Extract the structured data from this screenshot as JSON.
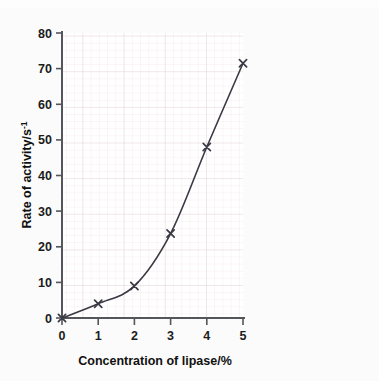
{
  "figure": {
    "background_color": "#fbfbfb",
    "plot_background_color": "#ffffff",
    "axis_color": "#4a4a4a",
    "grid_major_color": "#e6d9dc",
    "grid_minor_color": "#f1e6e8",
    "series_color": "#3a3a44",
    "marker": "x"
  },
  "chart_data": {
    "type": "line",
    "title": "",
    "subtitle": "",
    "xlabel": "Concentration of lipase/%",
    "ylabel": "Rate of activity/s",
    "ylabel_superscript": "-1",
    "x": [
      0,
      1,
      2,
      3,
      4,
      5
    ],
    "values": [
      0,
      4,
      9,
      23.7,
      48,
      71.5
    ],
    "series": [
      {
        "name": "Rate of activity",
        "x": [
          0,
          1,
          2,
          3,
          4,
          5
        ],
        "values": [
          0,
          4,
          9,
          23.7,
          48,
          71.5
        ]
      }
    ],
    "xlim": [
      0,
      5
    ],
    "ylim": [
      0,
      80
    ],
    "xticks": [
      0,
      1,
      2,
      3,
      4,
      5
    ],
    "yticks": [
      0,
      10,
      20,
      30,
      40,
      50,
      60,
      70,
      80
    ],
    "xtick_labels": [
      "0",
      "1",
      "2",
      "3",
      "4",
      "5"
    ],
    "ytick_labels": [
      "0",
      "10",
      "20",
      "30",
      "40",
      "50",
      "60",
      "70",
      "80"
    ],
    "grid": true,
    "grid_minor": true,
    "minor_step_x": 0.2,
    "minor_step_y": 2,
    "legend": false,
    "legend_position": "none",
    "annotations": []
  }
}
